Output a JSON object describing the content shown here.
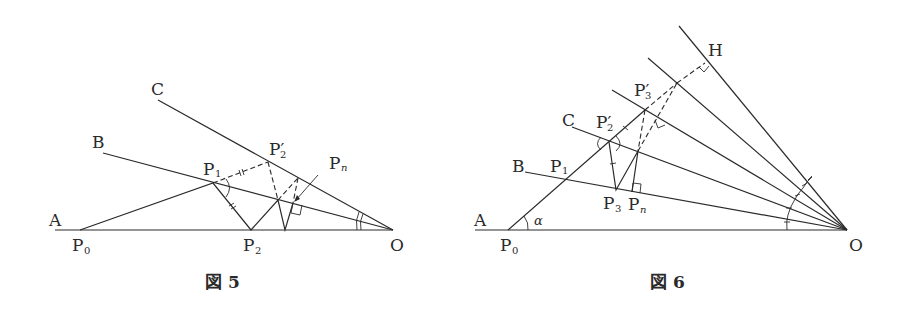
{
  "figure5": {
    "caption": "図 5",
    "labels": {
      "A": "A",
      "B": "B",
      "C": "C",
      "O": "O",
      "P0": "P",
      "P0_sub": "0",
      "P1": "P",
      "P1_sub": "1",
      "P2": "P",
      "P2_sub": "2",
      "P2prime": "P′",
      "P2prime_sub": "2",
      "Pn": "P",
      "Pn_sub": "n"
    }
  },
  "figure6": {
    "caption": "図 6",
    "labels": {
      "A": "A",
      "B": "B",
      "C": "C",
      "H": "H",
      "O": "O",
      "alpha": "α",
      "P0": "P",
      "P0_sub": "0",
      "P1": "P",
      "P1_sub": "1",
      "P2prime": "P′",
      "P2prime_sub": "2",
      "P3prime": "P′",
      "P3prime_sub": "3",
      "P3": "P",
      "P3_sub": "3",
      "Pn": "P",
      "Pn_sub": "n"
    }
  }
}
